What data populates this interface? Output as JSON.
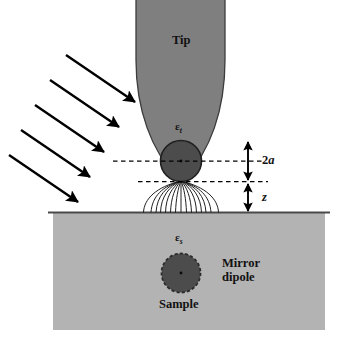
{
  "figure": {
    "title_alt": "Dipole model of a scattering near-field optical microscope tip above a sample surface",
    "colors": {
      "tip_fill": "#7f7f7f",
      "tip_stroke": "#3c3c3c",
      "sample_fill": "#b3b3b3",
      "sample_stroke": "#555555",
      "dipole_fill": "#4c4c4c",
      "dipole_stroke": "#2b2b2b",
      "field_line": "#1a1a1a",
      "arrow": "#000000",
      "dashed": "#000000",
      "background": "#ffffff",
      "text": "#111111"
    }
  },
  "labels": {
    "tip": "Tip",
    "sample": "Sample",
    "mirror_dipole_line1": "Mirror",
    "mirror_dipole_line2": "dipole",
    "epsilon_tip": "ε",
    "epsilon_tip_sub": "t",
    "epsilon_sample": "ε",
    "epsilon_sample_sub": "s",
    "diameter": "2a",
    "diameter_prefix": "2",
    "diameter_italic": "a",
    "gap": "z"
  },
  "geometry": {
    "tip_top_left_x": 136,
    "tip_top_right_x": 225,
    "tip_apex_y": 178,
    "dipole_center_x": 181,
    "dipole_center_y": 161,
    "dipole_radius": 20,
    "surface_y": 212,
    "sample_left_x": 53,
    "sample_right_x": 325,
    "sample_bottom_y": 330,
    "mirror_center_x": 181,
    "mirror_center_y": 273,
    "mirror_radius": 19,
    "gap_z_px": 31,
    "field_line_count": 13,
    "arrow_count": 5
  },
  "annotations": {
    "dimension_2a_top_y": 141,
    "dimension_2a_bottom_y": 181,
    "dimension_z_top_y": 181,
    "dimension_z_bottom_y": 212,
    "dimension_axis_x": 248,
    "dashed_left_x": 113,
    "dashed_right_x": 268
  },
  "illumination": {
    "description": "Five parallel incident light arrows pointing down-right toward the tip",
    "arrows": [
      {
        "x1": 66,
        "y1": 55,
        "x2": 138,
        "y2": 104
      },
      {
        "x1": 50,
        "y1": 80,
        "x2": 122,
        "y2": 129
      },
      {
        "x1": 34,
        "y1": 105,
        "x2": 106,
        "y2": 154
      },
      {
        "x1": 20,
        "y1": 130,
        "x2": 92,
        "y2": 179
      },
      {
        "x1": 8,
        "y1": 155,
        "x2": 80,
        "y2": 204
      }
    ]
  }
}
